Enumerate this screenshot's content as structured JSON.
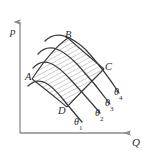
{
  "figure": {
    "kind": "line-diagram",
    "background_color": "#ffffff",
    "line_color": "#3a3a3a",
    "axis_color": "#8a8a8a",
    "hatch_color": "#8c8c8c",
    "axes": {
      "y_axis_label": "p",
      "x_axis_label": "Q",
      "origin": {
        "x": 20,
        "y": 133
      },
      "y_axis_top": {
        "x": 20,
        "y": 18
      },
      "x_axis_right": {
        "x": 133,
        "y": 133
      },
      "arrowheads": true
    },
    "curves": [
      {
        "name": "theta-1",
        "label": "θ",
        "subscript": "1",
        "label_x": 74,
        "label_y": 116
      },
      {
        "name": "theta-2",
        "label": "θ",
        "subscript": "2",
        "label_x": 94,
        "label_y": 108
      },
      {
        "name": "theta-3",
        "label": "θ",
        "subscript": "3",
        "label_x": 105,
        "label_y": 99
      },
      {
        "name": "theta-4",
        "label": "θ",
        "subscript": "4",
        "label_x": 114,
        "label_y": 88
      }
    ],
    "points": [
      {
        "name": "point-a",
        "label": "A",
        "label_x": 25,
        "label_y": 72
      },
      {
        "name": "point-b",
        "label": "B",
        "label_x": 65,
        "label_y": 32
      },
      {
        "name": "point-c",
        "label": "C",
        "label_x": 104,
        "label_y": 64
      },
      {
        "name": "point-d",
        "label": "D",
        "label_x": 58,
        "label_y": 107
      }
    ],
    "shaded_region": {
      "name": "hatched-region-abcd",
      "vertices": "A,B,C,D",
      "hatch_style": "diagonal-lines"
    }
  }
}
